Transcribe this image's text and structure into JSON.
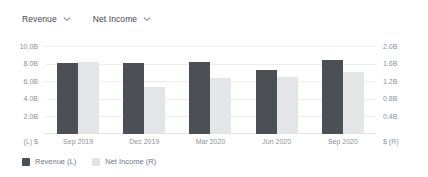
{
  "toolbar": {
    "left_metric": {
      "label": "Revenue",
      "icon": "chevron-down-icon"
    },
    "right_metric": {
      "label": "Net Income",
      "icon": "chevron-down-icon"
    }
  },
  "legend": [
    {
      "label": "Revenue (L)",
      "color": "#4c4f54"
    },
    {
      "label": "Net Income (R)",
      "color": "#e3e5e7"
    }
  ],
  "colors": {
    "revenue_bar": "#4c4f54",
    "net_income_bar": "#e3e5e7",
    "gridline": "#ededef",
    "axis_text": "#8d9299",
    "background": "#ffffff"
  },
  "chart_data": {
    "type": "bar",
    "title": "",
    "xlabel": "",
    "categories": [
      "Sep 2019",
      "Dec 2019",
      "Mar 2020",
      "Jun 2020",
      "Sep 2020"
    ],
    "series": [
      {
        "name": "Revenue (L)",
        "axis": "left",
        "color": "#4c4f54",
        "values": [
          8.1,
          8.05,
          8.15,
          7.3,
          8.45
        ],
        "unit": "B"
      },
      {
        "name": "Net Income (R)",
        "axis": "right",
        "color": "#e3e5e7",
        "values": [
          1.63,
          1.07,
          1.27,
          1.29,
          1.4
        ],
        "unit": "B"
      }
    ],
    "left_axis": {
      "label": "(L)  $",
      "ylim": [
        0,
        10
      ],
      "ticks": [
        "10.0B",
        "8.0B",
        "6.0B",
        "4.0B",
        "2.0B"
      ],
      "tick_values": [
        10,
        8,
        6,
        4,
        2
      ]
    },
    "right_axis": {
      "label": "$  (R)",
      "ylim": [
        0,
        2.0
      ],
      "ticks": [
        "2.0B",
        "1.6B",
        "1.2B",
        "0.8B",
        "0.4B"
      ],
      "tick_values": [
        2.0,
        1.6,
        1.2,
        0.8,
        0.4
      ]
    },
    "grid": true,
    "legend_position": "bottom-left"
  }
}
